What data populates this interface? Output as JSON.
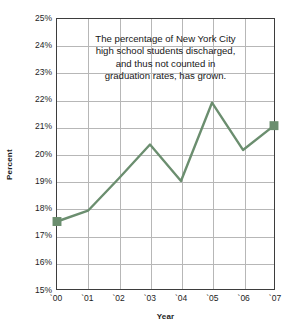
{
  "chart_data": {
    "type": "line",
    "title": "",
    "xlabel": "Year",
    "ylabel": "Percent",
    "categories": [
      "`00",
      "`01",
      "`02",
      "`03",
      "`04",
      "`05",
      "`06",
      "`07"
    ],
    "x": [
      2000,
      2001,
      2002,
      2003,
      2004,
      2005,
      2006,
      2007
    ],
    "values": [
      17.5,
      17.9,
      19.1,
      20.35,
      19.0,
      21.9,
      20.15,
      21.05
    ],
    "series": [
      {
        "name": "Percentage discharged",
        "values": [
          17.5,
          17.9,
          19.1,
          20.35,
          19.0,
          21.9,
          20.15,
          21.05
        ]
      }
    ],
    "ylim": [
      15,
      25
    ],
    "ytick_labels": [
      "25%",
      "24%",
      "23%",
      "22%",
      "21%",
      "20%",
      "19%",
      "18%",
      "17%",
      "16%",
      "15%"
    ],
    "ytick_values": [
      25,
      24,
      23,
      22,
      21,
      20,
      19,
      18,
      17,
      16,
      15
    ],
    "grid": true,
    "legend": "none",
    "line_color": "#6b8e6f",
    "marker_color": "#6b8e6f",
    "marker_endpoints_only": true,
    "annotations": [
      {
        "lines": [
          "The percentage of New York City",
          "high school students discharged,",
          "and thus not counted in",
          "graduation rates, has grown."
        ]
      }
    ]
  },
  "colors": {
    "line": "#6b8e6f",
    "marker": "#6b8e6f",
    "grid": "#b7b7b7",
    "frame": "#3d3d3d",
    "text": "#1d1d1d",
    "background": "#ffffff"
  }
}
